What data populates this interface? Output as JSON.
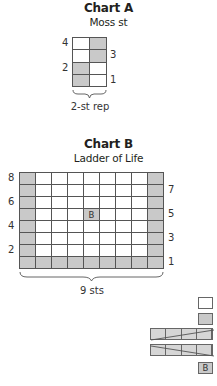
{
  "chart_a": {
    "title": "Chart A",
    "subtitle": "Moss st",
    "columns": 2,
    "rows_count": 4,
    "rows": [
      {
        "row": 4,
        "cells": [
          "white",
          "gray"
        ],
        "label_side": "left"
      },
      {
        "row": 3,
        "cells": [
          "white",
          "gray"
        ],
        "label_side": "right"
      },
      {
        "row": 2,
        "cells": [
          "gray",
          "white"
        ],
        "label_side": "left"
      },
      {
        "row": 1,
        "cells": [
          "gray",
          "white"
        ],
        "label_side": "right"
      }
    ],
    "row_labels": {
      "r4": "4",
      "r3": "3",
      "r2": "2",
      "r1": "1"
    },
    "repeat_label": "2-st rep"
  },
  "chart_b": {
    "title": "Chart B",
    "subtitle": "Ladder of Life",
    "columns": 9,
    "rows_count": 8,
    "rows": [
      {
        "row": 8,
        "cells": [
          "gray",
          "white",
          "white",
          "white",
          "white",
          "white",
          "white",
          "white",
          "gray"
        ],
        "label_side": "left"
      },
      {
        "row": 7,
        "cells": [
          "gray",
          "white",
          "white",
          "white",
          "white",
          "white",
          "white",
          "white",
          "gray"
        ],
        "label_side": "right"
      },
      {
        "row": 6,
        "cells": [
          "gray",
          "white",
          "white",
          "white",
          "white",
          "white",
          "white",
          "white",
          "gray"
        ],
        "label_side": "left"
      },
      {
        "row": 5,
        "cells": [
          "gray",
          "white",
          "white",
          "white",
          "B",
          "white",
          "white",
          "white",
          "gray"
        ],
        "label_side": "right"
      },
      {
        "row": 4,
        "cells": [
          "gray",
          "white",
          "white",
          "white",
          "white",
          "white",
          "white",
          "white",
          "gray"
        ],
        "label_side": "left"
      },
      {
        "row": 3,
        "cells": [
          "gray",
          "white",
          "white",
          "white",
          "white",
          "white",
          "white",
          "white",
          "gray"
        ],
        "label_side": "right"
      },
      {
        "row": 2,
        "cells": [
          "gray",
          "white",
          "white",
          "white",
          "white",
          "white",
          "white",
          "white",
          "gray"
        ],
        "label_side": "left"
      },
      {
        "row": 1,
        "cells": [
          "gray",
          "gray",
          "gray",
          "gray",
          "gray",
          "gray",
          "gray",
          "gray",
          "gray"
        ],
        "label_side": "right"
      }
    ],
    "row_labels": {
      "r8": "8",
      "r7": "7",
      "r6": "6",
      "r5": "5",
      "r4": "4",
      "r3": "3",
      "r2": "2",
      "r1": "1"
    },
    "bobble_label": "B",
    "width_label": "9 sts"
  },
  "key": {
    "items": [
      {
        "symbol": "white-square"
      },
      {
        "symbol": "gray-square"
      },
      {
        "symbol": "4-st-cable-right-slant"
      },
      {
        "symbol": "4-st-cable-left-slant"
      },
      {
        "symbol": "bobble",
        "label": "B"
      }
    ],
    "bobble_label": "B"
  },
  "colors": {
    "gray_cell": "#c9c9c9",
    "white_cell": "#ffffff",
    "grid_line": "#555555",
    "text": "#231f20"
  }
}
